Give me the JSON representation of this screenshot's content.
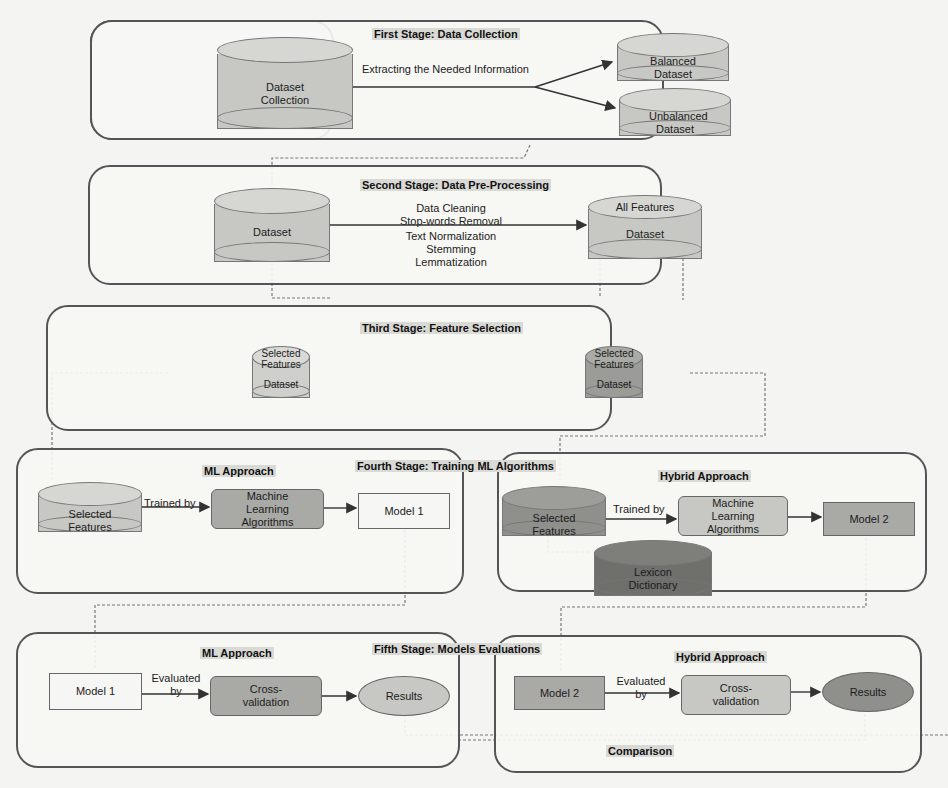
{
  "colors": {
    "light_fill": "#cfcfcc",
    "mid_fill": "#a9a9a6",
    "dark_fill": "#7f7f7c",
    "white_fill": "#f6f6f4",
    "stage_border": "#555555"
  },
  "stages": {
    "first": {
      "title": "First Stage: Data Collection",
      "source": "Dataset Collection",
      "arrow_label": "Extracting the Needed Information",
      "outputs": [
        "Balanced Dataset",
        "Unbalanced Dataset"
      ]
    },
    "second": {
      "title": "Second Stage: Data Pre-Processing",
      "source": "Dataset",
      "steps_top": [
        "Data Cleaning",
        "Stop-words Removal"
      ],
      "steps_bottom": [
        "Text Normalization",
        "Stemming",
        "Lemmatization"
      ],
      "output_top": "All Features",
      "output_bottom": "Dataset"
    },
    "third": {
      "title": "Third Stage: Feature Selection",
      "left_top": "Selected Features",
      "left_bottom": "Dataset",
      "right_top": "Selected Features",
      "right_bottom": "Dataset"
    },
    "fourth": {
      "title": "Fourth Stage: Training ML Algorithms",
      "ml": {
        "heading": "ML Approach",
        "input": "Selected Features",
        "arrow_label": "Trained by",
        "algo": "Machine Learning Algorithms",
        "model": "Model 1"
      },
      "hybrid": {
        "heading": "Hybrid Approach",
        "input": "Selected Features",
        "lexicon": "Lexicon Dictionary",
        "arrow_label": "Trained by",
        "algo": "Machine Learning Algorithms",
        "model": "Model 2"
      }
    },
    "fifth": {
      "title": "Fifth Stage: Models Evaluations",
      "ml": {
        "heading": "ML Approach",
        "model": "Model 1",
        "arrow_label": "Evaluated by",
        "method": "Cross-validation",
        "result": "Results"
      },
      "hybrid": {
        "heading": "Hybrid Approach",
        "model": "Model 2",
        "arrow_label": "Evaluated by",
        "method": "Cross-validation",
        "result": "Results"
      },
      "comparison": "Comparison"
    }
  }
}
